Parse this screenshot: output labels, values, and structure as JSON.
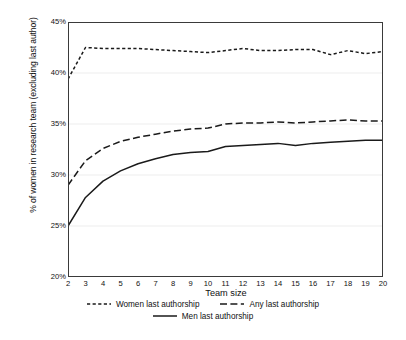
{
  "chart_data": {
    "type": "line",
    "title": "",
    "subtitle": "",
    "xlabel": "Team size",
    "ylabel": "% of women in research team (excluding last author)",
    "x": [
      2,
      3,
      4,
      5,
      6,
      7,
      8,
      9,
      10,
      11,
      12,
      13,
      14,
      15,
      16,
      17,
      18,
      19,
      20
    ],
    "xtick_labels": [
      "2",
      "3",
      "4",
      "5",
      "6",
      "7",
      "8",
      "9",
      "10",
      "11",
      "12",
      "13",
      "14",
      "15",
      "16",
      "17",
      "18",
      "19",
      "20"
    ],
    "ytick_labels": [
      "45%",
      "40%",
      "35%",
      "30%",
      "25%",
      "20%"
    ],
    "ytick_values": [
      45,
      40,
      35,
      30,
      25,
      20
    ],
    "ylim": [
      20,
      45
    ],
    "xlim": [
      2,
      20
    ],
    "grid": "horizontal",
    "legend_position": "bottom",
    "series": [
      {
        "name": "Women last authorship",
        "style": "short-dashed",
        "color": "#1a1a1a",
        "values": [
          39.4,
          42.5,
          42.4,
          42.4,
          42.4,
          42.3,
          42.2,
          42.1,
          42.0,
          42.2,
          42.4,
          42.2,
          42.2,
          42.3,
          42.3,
          41.8,
          42.2,
          41.9,
          42.1
        ]
      },
      {
        "name": "Any last authorship",
        "style": "long-dashed",
        "color": "#1a1a1a",
        "values": [
          29.0,
          31.4,
          32.6,
          33.3,
          33.7,
          34.0,
          34.3,
          34.5,
          34.6,
          35.0,
          35.1,
          35.1,
          35.2,
          35.1,
          35.2,
          35.3,
          35.4,
          35.3,
          35.3
        ]
      },
      {
        "name": "Men last authorship",
        "style": "solid",
        "color": "#1a1a1a",
        "values": [
          25.0,
          27.8,
          29.4,
          30.4,
          31.1,
          31.6,
          32.0,
          32.2,
          32.3,
          32.8,
          32.9,
          33.0,
          33.1,
          32.9,
          33.1,
          33.2,
          33.3,
          33.4,
          33.4
        ]
      }
    ]
  },
  "legend": {
    "items": [
      {
        "label": "Women last authorship",
        "style": "short-dashed"
      },
      {
        "label": "Any last authorship",
        "style": "long-dashed"
      },
      {
        "label": "Men last authorship",
        "style": "solid"
      }
    ]
  }
}
